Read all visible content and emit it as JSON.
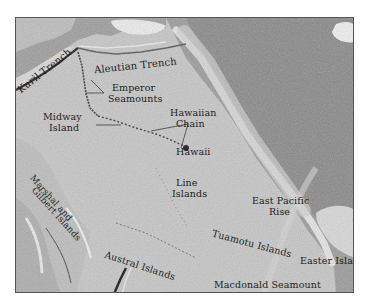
{
  "map": {
    "title": "Pacific Ocean seafloor features",
    "colors": {
      "ocean_floor": "#c4c4c4",
      "land_light": "#e6e6e6",
      "land_dark": "#8a8a8a",
      "trench": "#1a1a1a",
      "label_text": "#222222",
      "frame": "#555555"
    },
    "labels": {
      "kuril_trench": "Kuril Trench",
      "aleutian_trench": "Aleutian Trench",
      "emperor_1": "Emperor",
      "emperor_2": "Seamounts",
      "midway_1": "Midway",
      "midway_2": "Island",
      "hawaiian_1": "Hawaiian",
      "hawaiian_2": "Chain",
      "hawaii": "Hawaii",
      "line_1": "Line",
      "line_2": "Islands",
      "marshall_1": "Marshal and",
      "marshall_2": "Gilbert Islands",
      "east_pacific_1": "East Pacific",
      "east_pacific_2": "Rise",
      "tuamotu": "Tuamotu Islands",
      "austral": "Austral Islands",
      "easter": "Easter Island",
      "macdonald": "Macdonald Seamount"
    }
  }
}
